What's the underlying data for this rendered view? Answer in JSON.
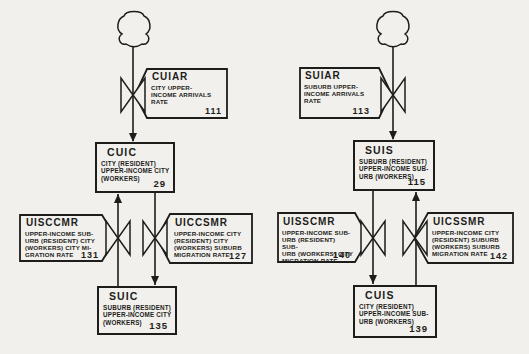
{
  "diagram": {
    "ink_color": "#1d1d1b",
    "paper_color": "#f1f0ec",
    "left": {
      "arrival": {
        "acronym": "CUIAR",
        "desc": "CITY UPPER-\nINCOME ARRIVALS\nRATE",
        "number": "111"
      },
      "level_city": {
        "acronym": "CUIC",
        "desc": "CITY (RESIDENT)\nUPPER-INCOME CITY\n(WORKERS)",
        "number": "29"
      },
      "rate_to_city": {
        "acronym": "UISCCMR",
        "desc": "UPPER-INCOME SUB-\nURB (RESIDENT) CITY\n(WORKERS) CITY MI-\nGRATION RATE",
        "number": "131"
      },
      "rate_to_suburb": {
        "acronym": "UICCSMR",
        "desc": "UPPER-INCOME CITY\n(RESIDENT) CITY\n(WORKERS) SUBURB\nMIGRATION RATE",
        "number": "127"
      },
      "level_suburb": {
        "acronym": "SUIC",
        "desc": "SUBURB (RESIDENT)\nUPPER-INCOME CITY\n(WORKERS)",
        "number": "135"
      }
    },
    "right": {
      "arrival": {
        "acronym": "SUIAR",
        "desc": "SUBURB UPPER-\nINCOME ARRIVALS\nRATE",
        "number": "113"
      },
      "level_suburb": {
        "acronym": "SUIS",
        "desc": "SUBURB (RESIDENT)\nUPPER-INCOME SUB-\nURB (WORKERS)",
        "number": "115"
      },
      "rate_to_city": {
        "acronym": "UISSCMR",
        "desc": "UPPER-INCOME SUB-\nURB (RESIDENT) SUB-\nURB (WORKERS) CITY\nMIGRATION RATE",
        "number": "140"
      },
      "rate_to_suburb": {
        "acronym": "UICSSMR",
        "desc": "UPPER-INCOME CITY\n(RESIDENT) SUBURB\n(WORKERS) SUBURB\nMIGRATION RATE",
        "number": "142"
      },
      "level_city": {
        "acronym": "CUIS",
        "desc": "CITY (RESIDENT)\nUPPER-INCOME SUB-\nURB (WORKERS)",
        "number": "139"
      }
    }
  }
}
